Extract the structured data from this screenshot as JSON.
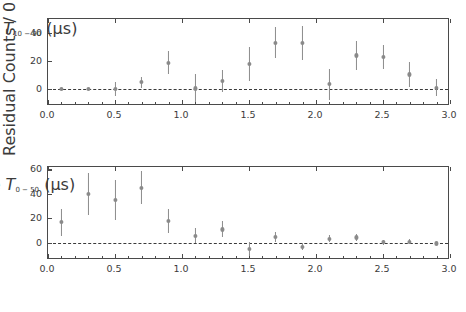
{
  "figure": {
    "background": "#ffffff",
    "marker_color": "#8a8a8a",
    "errorbar_color": "#8c8c8c",
    "axis_color": "#4a4a4a",
    "zero_line_color": "#3a3a3a"
  },
  "chart_data": [
    {
      "type": "scatter",
      "panel": "top",
      "title": "",
      "xlabel_prefix": "Rise-time ",
      "xlabel_symbol": "T",
      "xlabel_subscript": "10 − 90",
      "xlabel_units": " (μs)",
      "ylabel": "Residual Counts / 0.20 μs",
      "xlim": [
        0.0,
        3.0
      ],
      "ylim": [
        -12,
        50
      ],
      "xticks": [
        0.0,
        0.5,
        1.0,
        1.5,
        2.0,
        2.5,
        3.0
      ],
      "xticklabels": [
        "0.0",
        "0.5",
        "1.0",
        "1.5",
        "2.0",
        "2.5",
        "3.0"
      ],
      "xminorticks": [
        0.1,
        0.2,
        0.3,
        0.4,
        0.6,
        0.7,
        0.8,
        0.9,
        1.1,
        1.2,
        1.3,
        1.4,
        1.6,
        1.7,
        1.8,
        1.9,
        2.1,
        2.2,
        2.3,
        2.4,
        2.6,
        2.7,
        2.8,
        2.9
      ],
      "yticks": [
        0,
        20,
        40
      ],
      "yticklabels": [
        "0",
        "20",
        "40"
      ],
      "grid": false,
      "legend": null,
      "zero_line": 0,
      "x": [
        0.1,
        0.3,
        0.5,
        0.7,
        0.9,
        1.1,
        1.3,
        1.5,
        1.7,
        1.9,
        2.1,
        2.3,
        2.5,
        2.7,
        2.9
      ],
      "y": [
        0.0,
        0.0,
        0.0,
        5.0,
        19.0,
        0.5,
        6.0,
        18.0,
        33.0,
        33.0,
        3.5,
        24.0,
        23.0,
        10.5,
        1.0
      ],
      "yerr": [
        0.6,
        0.8,
        5.0,
        4.0,
        8.5,
        10.0,
        8.0,
        12.0,
        11.0,
        12.0,
        11.0,
        10.0,
        8.5,
        9.0,
        6.0
      ]
    },
    {
      "type": "scatter",
      "panel": "bottom",
      "title": "",
      "xlabel_prefix": "Rise-time ",
      "xlabel_symbol": "T",
      "xlabel_subscript": "0 − 50",
      "xlabel_units": " (μs)",
      "ylabel": "Residual Counts / 0.20 μs",
      "xlim": [
        0.0,
        3.0
      ],
      "ylim": [
        -14,
        62
      ],
      "xticks": [
        0.0,
        0.5,
        1.0,
        1.5,
        2.0,
        2.5,
        3.0
      ],
      "xticklabels": [
        "0.0",
        "0.5",
        "1.0",
        "1.5",
        "2.0",
        "2.5",
        "3.0"
      ],
      "xminorticks": [
        0.1,
        0.2,
        0.3,
        0.4,
        0.6,
        0.7,
        0.8,
        0.9,
        1.1,
        1.2,
        1.3,
        1.4,
        1.6,
        1.7,
        1.8,
        1.9,
        2.1,
        2.2,
        2.3,
        2.4,
        2.6,
        2.7,
        2.8,
        2.9
      ],
      "yticks": [
        0,
        20,
        40,
        60
      ],
      "yticklabels": [
        "0",
        "20",
        "40",
        "60"
      ],
      "grid": false,
      "legend": null,
      "zero_line": 0,
      "x": [
        0.1,
        0.3,
        0.5,
        0.7,
        0.9,
        1.1,
        1.3,
        1.5,
        1.7,
        1.9,
        2.1,
        2.3,
        2.5,
        2.7,
        2.9
      ],
      "y": [
        17.0,
        40.0,
        35.0,
        45.0,
        18.0,
        6.0,
        11.0,
        -5.0,
        5.0,
        -3.0,
        3.5,
        4.5,
        0.5,
        1.0,
        -0.5
      ],
      "yerr": [
        11.0,
        17.0,
        16.5,
        13.5,
        10.0,
        6.0,
        6.5,
        5.5,
        4.0,
        3.0,
        3.0,
        3.0,
        2.0,
        2.0,
        1.5
      ]
    }
  ]
}
